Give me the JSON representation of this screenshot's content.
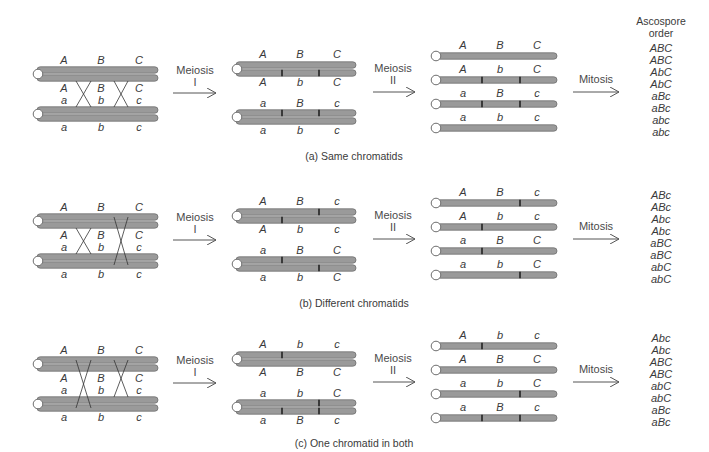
{
  "colors": {
    "chromatid_fill": "#9a9a9a",
    "chromatid_stroke": "#6e6e6e",
    "centromere_fill": "#ffffff",
    "text": "#3a3a3a",
    "arrow": "#555555"
  },
  "header": {
    "ascospore_order_line1": "Ascospore",
    "ascospore_order_line2": "order"
  },
  "steps": {
    "meiosis1_line1": "Meiosis",
    "meiosis1_line2": "I",
    "meiosis2_line1": "Meiosis",
    "meiosis2_line2": "II",
    "mitosis": "Mitosis"
  },
  "panels": [
    {
      "id": "a",
      "caption": "(a) Same chromatids",
      "crossover_lines": "same",
      "stage1": {
        "top_above": [
          "A",
          "B",
          "C"
        ],
        "top_below": [
          "A",
          "B",
          "C"
        ],
        "bottom_above": [
          "a",
          "b",
          "c"
        ],
        "bottom_below": [
          "a",
          "b",
          "c"
        ]
      },
      "stage2": {
        "pair1_above": [
          "A",
          "B",
          "C"
        ],
        "pair1_below": [
          "A",
          "b",
          "C"
        ],
        "pair2_above": [
          "a",
          "B",
          "c"
        ],
        "pair2_below": [
          "a",
          "b",
          "c"
        ]
      },
      "stage3": [
        [
          "A",
          "B",
          "C"
        ],
        [
          "A",
          "b",
          "C"
        ],
        [
          "a",
          "B",
          "c"
        ],
        [
          "a",
          "b",
          "c"
        ]
      ],
      "ascospores": [
        "ABC",
        "ABC",
        "AbC",
        "AbC",
        "aBc",
        "aBc",
        "abc",
        "abc"
      ]
    },
    {
      "id": "b",
      "caption": "(b) Different chromatids",
      "crossover_lines": "different",
      "stage1": {
        "top_above": [
          "A",
          "B",
          "C"
        ],
        "top_below": [
          "A",
          "B",
          "C"
        ],
        "bottom_above": [
          "a",
          "b",
          "c"
        ],
        "bottom_below": [
          "a",
          "b",
          "c"
        ]
      },
      "stage2": {
        "pair1_above": [
          "A",
          "B",
          "c"
        ],
        "pair1_below": [
          "A",
          "b",
          "c"
        ],
        "pair2_above": [
          "a",
          "B",
          "C"
        ],
        "pair2_below": [
          "a",
          "b",
          "C"
        ]
      },
      "stage3": [
        [
          "A",
          "B",
          "c"
        ],
        [
          "A",
          "b",
          "c"
        ],
        [
          "a",
          "B",
          "C"
        ],
        [
          "a",
          "b",
          "C"
        ]
      ],
      "ascospores": [
        "ABc",
        "ABc",
        "Abc",
        "Abc",
        "aBC",
        "aBC",
        "abC",
        "abC"
      ]
    },
    {
      "id": "c",
      "caption": "(c) One chromatid in both",
      "crossover_lines": "one-in-both",
      "stage1": {
        "top_above": [
          "A",
          "B",
          "C"
        ],
        "top_below": [
          "A",
          "B",
          "C"
        ],
        "bottom_above": [
          "a",
          "b",
          "c"
        ],
        "bottom_below": [
          "a",
          "b",
          "c"
        ]
      },
      "stage2": {
        "pair1_above": [
          "A",
          "b",
          "c"
        ],
        "pair1_below": [
          "A",
          "B",
          "C"
        ],
        "pair2_above": [
          "a",
          "b",
          "C"
        ],
        "pair2_below": [
          "a",
          "B",
          "c"
        ]
      },
      "stage3": [
        [
          "A",
          "b",
          "c"
        ],
        [
          "A",
          "B",
          "C"
        ],
        [
          "a",
          "b",
          "C"
        ],
        [
          "a",
          "B",
          "c"
        ]
      ],
      "ascospores": [
        "Abc",
        "Abc",
        "ABC",
        "ABC",
        "abC",
        "abC",
        "aBc",
        "aBc"
      ]
    }
  ]
}
